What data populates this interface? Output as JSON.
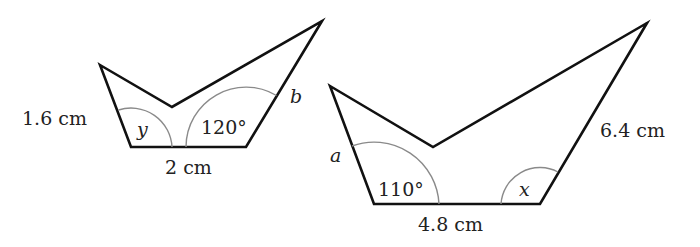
{
  "diagram": {
    "colors": {
      "outline": "#111111",
      "angle_arc": "#8a8a8a",
      "text": "#222222"
    },
    "small_shape": {
      "labels": {
        "left_side": "1.6 cm",
        "bottom_side": "2 cm",
        "right_side": "b",
        "left_angle": "y",
        "right_angle": "120°"
      }
    },
    "large_shape": {
      "labels": {
        "left_side": "a",
        "bottom_side": "4.8 cm",
        "right_side": "6.4 cm",
        "left_angle": "110°",
        "right_angle": "x"
      }
    }
  }
}
